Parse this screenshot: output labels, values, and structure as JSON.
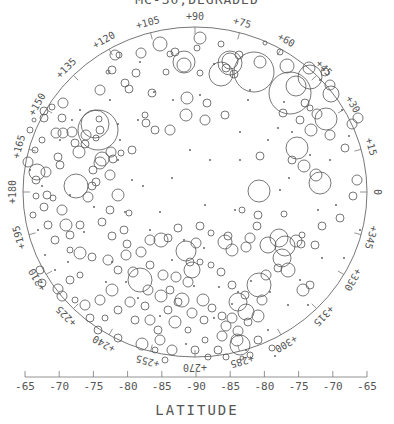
{
  "chart_data": {
    "type": "scatter",
    "title": "MC-30,DEGRADED",
    "subtitle": "",
    "xlabel": "LATITUDE",
    "ylabel": "",
    "projection": "polar stereographic (south pole)",
    "x_ticks": [
      "-65",
      "-70",
      "-75",
      "-80",
      "-85",
      "-90",
      "-85",
      "-80",
      "-75",
      "-70",
      "-65"
    ],
    "longitude_labels": [
      "0",
      "+15",
      "+30",
      "+45",
      "+60",
      "+75",
      "+90",
      "+105",
      "+120",
      "+135",
      "+150",
      "+165",
      "+180",
      "+195",
      "+210",
      "+225",
      "+240",
      "+255",
      "+270",
      "+285",
      "+300",
      "+315",
      "+330",
      "+345"
    ],
    "grid": false,
    "legend": null,
    "annotation": "Craters plotted as circles, size proportional to crater diameter",
    "craters": [
      [
        200,
        38,
        6
      ],
      [
        221,
        44,
        3
      ],
      [
        265,
        43,
        2
      ],
      [
        280,
        52,
        3
      ],
      [
        239,
        55,
        4
      ],
      [
        160,
        44,
        7
      ],
      [
        170,
        54,
        3
      ],
      [
        141,
        53,
        5
      ],
      [
        136,
        73,
        4
      ],
      [
        184,
        62,
        11
      ],
      [
        184,
        65,
        7
      ],
      [
        221,
        74,
        12
      ],
      [
        226,
        68,
        4
      ],
      [
        234,
        74,
        4
      ],
      [
        230,
        63,
        12
      ],
      [
        230,
        61,
        8
      ],
      [
        254,
        72,
        20
      ],
      [
        260,
        62,
        6
      ],
      [
        287,
        66,
        7
      ],
      [
        309,
        68,
        6
      ],
      [
        325,
        72,
        4
      ],
      [
        330,
        85,
        5
      ],
      [
        310,
        77,
        12
      ],
      [
        290,
        93,
        21
      ],
      [
        296,
        86,
        10
      ],
      [
        331,
        94,
        8
      ],
      [
        326,
        119,
        11
      ],
      [
        358,
        118,
        5
      ],
      [
        352,
        124,
        5
      ],
      [
        305,
        103,
        4
      ],
      [
        310,
        108,
        3
      ],
      [
        317,
        114,
        5
      ],
      [
        300,
        120,
        4
      ],
      [
        283,
        113,
        4
      ],
      [
        311,
        130,
        6
      ],
      [
        297,
        148,
        11
      ],
      [
        292,
        160,
        4
      ],
      [
        304,
        166,
        6
      ],
      [
        320,
        183,
        11
      ],
      [
        316,
        175,
        6
      ],
      [
        340,
        218,
        4
      ],
      [
        322,
        226,
        4
      ],
      [
        315,
        245,
        4
      ],
      [
        259,
        191,
        11
      ],
      [
        260,
        156,
        4
      ],
      [
        225,
        115,
        4
      ],
      [
        205,
        120,
        5
      ],
      [
        207,
        103,
        4
      ],
      [
        200,
        73,
        3
      ],
      [
        197,
        48,
        3
      ],
      [
        175,
        52,
        4
      ],
      [
        186,
        115,
        6
      ],
      [
        115,
        55,
        5
      ],
      [
        119,
        55,
        3
      ],
      [
        108,
        72,
        2
      ],
      [
        100,
        90,
        5
      ],
      [
        112,
        70,
        4
      ],
      [
        125,
        83,
        4
      ],
      [
        86,
        135,
        5
      ],
      [
        63,
        103,
        5
      ],
      [
        52,
        107,
        3
      ],
      [
        62,
        118,
        4
      ],
      [
        63,
        133,
        5
      ],
      [
        72,
        132,
        5
      ],
      [
        75,
        143,
        4
      ],
      [
        85,
        144,
        4
      ],
      [
        96,
        138,
        3
      ],
      [
        100,
        163,
        6
      ],
      [
        102,
        159,
        7
      ],
      [
        79,
        152,
        6
      ],
      [
        93,
        170,
        4
      ],
      [
        60,
        165,
        4
      ],
      [
        58,
        157,
        4
      ],
      [
        100,
        130,
        4
      ],
      [
        99,
        119,
        3
      ],
      [
        98,
        130,
        20
      ],
      [
        95,
        124,
        14
      ],
      [
        111,
        152,
        5
      ],
      [
        113,
        159,
        4
      ],
      [
        121,
        153,
        3
      ],
      [
        132,
        150,
        4
      ],
      [
        46,
        172,
        5
      ],
      [
        37,
        172,
        8
      ],
      [
        36,
        180,
        4
      ],
      [
        44,
        207,
        4
      ],
      [
        48,
        225,
        4
      ],
      [
        55,
        240,
        4
      ],
      [
        70,
        235,
        4
      ],
      [
        76,
        186,
        12
      ],
      [
        56,
        133,
        5
      ],
      [
        44,
        111,
        4
      ],
      [
        44,
        118,
        4
      ],
      [
        35,
        150,
        3
      ],
      [
        92,
        186,
        4
      ],
      [
        80,
        225,
        4
      ],
      [
        80,
        253,
        6
      ],
      [
        70,
        280,
        4
      ],
      [
        85,
        305,
        5
      ],
      [
        58,
        289,
        5
      ],
      [
        62,
        296,
        5
      ],
      [
        40,
        270,
        4
      ],
      [
        42,
        283,
        4
      ],
      [
        110,
        175,
        5
      ],
      [
        118,
        195,
        6
      ],
      [
        108,
        260,
        5
      ],
      [
        118,
        270,
        4
      ],
      [
        130,
        302,
        5
      ],
      [
        140,
        280,
        12
      ],
      [
        145,
        306,
        4
      ],
      [
        150,
        320,
        5
      ],
      [
        168,
        310,
        4
      ],
      [
        188,
        282,
        5
      ],
      [
        192,
        270,
        8
      ],
      [
        203,
        300,
        6
      ],
      [
        212,
        308,
        4
      ],
      [
        222,
        316,
        4
      ],
      [
        226,
        326,
        5
      ],
      [
        232,
        318,
        5
      ],
      [
        238,
        302,
        9
      ],
      [
        246,
        312,
        8
      ],
      [
        262,
        300,
        5
      ],
      [
        259,
        285,
        12
      ],
      [
        266,
        275,
        5
      ],
      [
        278,
        268,
        4
      ],
      [
        282,
        258,
        9
      ],
      [
        288,
        270,
        7
      ],
      [
        303,
        290,
        6
      ],
      [
        310,
        285,
        4
      ],
      [
        240,
        345,
        10
      ],
      [
        237,
        340,
        6
      ],
      [
        238,
        331,
        5
      ],
      [
        258,
        340,
        4
      ],
      [
        272,
        348,
        3
      ],
      [
        226,
        357,
        3
      ],
      [
        242,
        358,
        2
      ],
      [
        218,
        350,
        4
      ],
      [
        205,
        340,
        3
      ],
      [
        188,
        330,
        3
      ],
      [
        172,
        350,
        5
      ],
      [
        158,
        330,
        4
      ],
      [
        160,
        340,
        5
      ],
      [
        175,
        322,
        6
      ],
      [
        182,
        300,
        7
      ],
      [
        170,
        290,
        4
      ],
      [
        150,
        265,
        4
      ],
      [
        141,
        252,
        5
      ],
      [
        127,
        244,
        4
      ],
      [
        150,
        240,
        5
      ],
      [
        161,
        240,
        7
      ],
      [
        168,
        238,
        4
      ],
      [
        186,
        251,
        10
      ],
      [
        196,
        243,
        5
      ],
      [
        211,
        233,
        3
      ],
      [
        225,
        242,
        7
      ],
      [
        228,
        236,
        4
      ],
      [
        232,
        250,
        6
      ],
      [
        246,
        247,
        5
      ],
      [
        250,
        238,
        5
      ],
      [
        257,
        226,
        4
      ],
      [
        268,
        245,
        8
      ],
      [
        279,
        238,
        9
      ],
      [
        285,
        246,
        10
      ],
      [
        296,
        241,
        6
      ],
      [
        301,
        244,
        4
      ],
      [
        200,
        226,
        4
      ],
      [
        112,
        236,
        4
      ],
      [
        102,
        222,
        4
      ],
      [
        88,
        197,
        5
      ],
      [
        110,
        210,
        4
      ],
      [
        129,
        213,
        3
      ],
      [
        62,
        210,
        5
      ],
      [
        66,
        225,
        6
      ],
      [
        126,
        255,
        5
      ],
      [
        112,
        290,
        6
      ],
      [
        100,
        300,
        5
      ],
      [
        163,
        275,
        5
      ],
      [
        176,
        277,
        5
      ],
      [
        190,
        262,
        4
      ],
      [
        200,
        262,
        3
      ],
      [
        211,
        265,
        3
      ],
      [
        221,
        272,
        4
      ],
      [
        232,
        285,
        4
      ],
      [
        245,
        295,
        4
      ],
      [
        258,
        316,
        6
      ],
      [
        248,
        322,
        4
      ],
      [
        222,
        336,
        5
      ],
      [
        204,
        320,
        4
      ],
      [
        192,
        313,
        5
      ],
      [
        178,
        302,
        4
      ],
      [
        161,
        296,
        6
      ],
      [
        148,
        290,
        5
      ],
      [
        133,
        272,
        5
      ],
      [
        124,
        230,
        4
      ],
      [
        178,
        228,
        4
      ],
      [
        258,
        215,
        4
      ],
      [
        242,
        210,
        3
      ],
      [
        284,
        214,
        3
      ],
      [
        302,
        235,
        3
      ],
      [
        353,
        196,
        4
      ],
      [
        357,
        180,
        5
      ],
      [
        345,
        148,
        4
      ],
      [
        330,
        135,
        5
      ],
      [
        47,
        195,
        4
      ],
      [
        53,
        198,
        3
      ],
      [
        36,
        196,
        3
      ],
      [
        33,
        215,
        3
      ],
      [
        96,
        182,
        4
      ],
      [
        42,
        140,
        3
      ],
      [
        28,
        162,
        5
      ],
      [
        30,
        130,
        3
      ],
      [
        34,
        120,
        2
      ],
      [
        145,
        115,
        3
      ],
      [
        155,
        130,
        4
      ],
      [
        170,
        130,
        5
      ],
      [
        187,
        98,
        6
      ],
      [
        152,
        93,
        4
      ],
      [
        166,
        72,
        3
      ],
      [
        129,
        89,
        4
      ],
      [
        146,
        123,
        4
      ],
      [
        80,
        275,
        3
      ],
      [
        70,
        250,
        3
      ],
      [
        92,
        257,
        4
      ],
      [
        75,
        300,
        3
      ],
      [
        90,
        318,
        4
      ],
      [
        105,
        318,
        3
      ],
      [
        118,
        310,
        4
      ],
      [
        135,
        320,
        4
      ],
      [
        142,
        344,
        6
      ],
      [
        118,
        338,
        4
      ],
      [
        98,
        330,
        4
      ],
      [
        155,
        350,
        3
      ],
      [
        165,
        360,
        3
      ],
      [
        195,
        350,
        4
      ],
      [
        208,
        357,
        3
      ],
      [
        250,
        355,
        3
      ]
    ],
    "dots": [
      [
        140,
        62
      ],
      [
        154,
        92
      ],
      [
        173,
        100
      ],
      [
        120,
        140
      ],
      [
        118,
        160
      ],
      [
        132,
        180
      ],
      [
        143,
        186
      ],
      [
        125,
        212
      ],
      [
        190,
        150
      ],
      [
        210,
        160
      ],
      [
        240,
        160
      ],
      [
        248,
        100
      ],
      [
        240,
        132
      ],
      [
        268,
        140
      ],
      [
        278,
        128
      ],
      [
        292,
        132
      ],
      [
        310,
        155
      ],
      [
        330,
        160
      ],
      [
        336,
        205
      ],
      [
        318,
        210
      ],
      [
        322,
        258
      ],
      [
        300,
        280
      ],
      [
        280,
        190
      ],
      [
        235,
        210
      ],
      [
        205,
        205
      ],
      [
        160,
        212
      ],
      [
        150,
        230
      ],
      [
        184,
        240
      ],
      [
        204,
        248
      ],
      [
        219,
        287
      ],
      [
        238,
        292
      ],
      [
        251,
        281
      ],
      [
        268,
        330
      ],
      [
        275,
        356
      ],
      [
        246,
        350
      ],
      [
        186,
        344
      ],
      [
        160,
        316
      ],
      [
        138,
        298
      ],
      [
        106,
        282
      ],
      [
        68,
        262
      ],
      [
        55,
        270
      ],
      [
        45,
        255
      ],
      [
        38,
        230
      ],
      [
        42,
        186
      ],
      [
        30,
        170
      ],
      [
        60,
        140
      ],
      [
        72,
        120
      ],
      [
        80,
        110
      ],
      [
        110,
        100
      ],
      [
        118,
        124
      ],
      [
        138,
        120
      ],
      [
        200,
        95
      ],
      [
        214,
        64
      ],
      [
        250,
        90
      ],
      [
        284,
        102
      ],
      [
        320,
        80
      ],
      [
        342,
        110
      ],
      [
        349,
        136
      ],
      [
        289,
        178
      ],
      [
        172,
        178
      ],
      [
        94,
        207
      ],
      [
        70,
        195
      ],
      [
        84,
        232
      ],
      [
        112,
        262
      ],
      [
        126,
        282
      ],
      [
        172,
        260
      ],
      [
        194,
        286
      ],
      [
        214,
        318
      ],
      [
        232,
        304
      ],
      [
        270,
        292
      ],
      [
        288,
        305
      ],
      [
        308,
        305
      ],
      [
        344,
        258
      ],
      [
        360,
        230
      ]
    ]
  },
  "x_axis": {
    "y": 377,
    "x_start": 25,
    "x_end": 367
  }
}
